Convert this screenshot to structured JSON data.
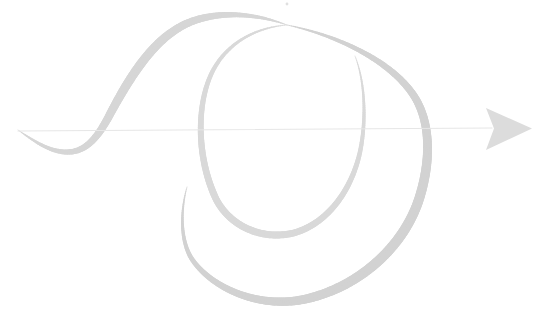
{
  "canvas": {
    "width": 551,
    "height": 321,
    "background_color": "#ffffff",
    "title": "Calligraphic flourish with horizontal arrow"
  },
  "palette": {
    "stroke_light": "#e3e3e3",
    "stroke_mid": "#d9d9d9",
    "stroke_dark": "#cfcfcf",
    "hairline": "#e8e8e8",
    "arrow_fill": "#dcdcdc",
    "speck": "#e0e0e0"
  },
  "elements": [
    {
      "id": "axis-line",
      "name": "horizontal-axis-line",
      "label": "Horizontal arrow shaft",
      "kind": "line",
      "color": "#e6e6e6",
      "stroke_width": 1.1,
      "x1": 18,
      "y1": 131,
      "x2": 492,
      "y2": 128
    },
    {
      "id": "arrow-head",
      "name": "arrow-head",
      "label": "Right-pointing arrow head",
      "kind": "polygon",
      "color": "#dcdcdc",
      "points": "486,108 532,128.5 486,150 494,128.5"
    },
    {
      "id": "sine-sweep",
      "name": "sine-sweep-stroke",
      "label": "Tapered sine sweep entering from left",
      "kind": "tapered-path",
      "color": "#d6d6d6",
      "max_width": 9,
      "path": "M 18,130 C 34,141 48,151 65,152 C 84,153 96,140 108,118 C 128,80 150,44 180,27 C 210,10 252,12 287,25"
    },
    {
      "id": "outer-loop",
      "name": "outer-loop-stroke",
      "label": "Outer descending loop of the spiral",
      "kind": "tapered-path",
      "color": "#d2d2d2",
      "max_width": 10,
      "path": "M 287,25 C 340,36 392,62 414,96 C 432,124 430,163 420,196 C 406,243 364,284 310,298 C 264,310 216,291 194,262 C 180,244 180,212 187,187"
    },
    {
      "id": "inner-loop",
      "name": "inner-loop-stroke",
      "label": "Inner loop of the spiral",
      "kind": "tapered-path",
      "color": "#d9d9d9",
      "max_width": 7,
      "path": "M 287,25 C 250,28 220,48 208,82 C 196,116 199,163 216,199 C 232,230 268,241 297,232 C 330,221 352,188 360,152 C 366,124 366,84 355,56"
    },
    {
      "id": "speck",
      "name": "ink-speck",
      "label": "Small ink speck near top centre",
      "kind": "dot",
      "color": "#e0e0e0",
      "cx": 287,
      "cy": 4,
      "r": 1.4
    }
  ],
  "chart_data": {
    "type": "line",
    "title": "Calligraphic flourish with horizontal arrow",
    "xlabel": "",
    "ylabel": "",
    "xlim": [
      0,
      551
    ],
    "ylim": [
      321,
      0
    ],
    "grid": false,
    "legend": "none",
    "annotations": [
      "Small faint speck near the top centre at (287, 4)"
    ],
    "series": [
      {
        "name": "horizontal-arrow",
        "style": "arrow",
        "color": "#e6e6e6",
        "x": [
          18,
          492
        ],
        "y": [
          131,
          128
        ]
      },
      {
        "name": "sine-sweep",
        "style": "tapered-curve",
        "color": "#d6d6d6",
        "x": [
          18,
          65,
          108,
          180,
          287
        ],
        "y": [
          130,
          152,
          118,
          27,
          25
        ]
      },
      {
        "name": "outer-loop",
        "style": "tapered-curve",
        "color": "#d2d2d2",
        "x": [
          287,
          414,
          425,
          420,
          310,
          194,
          187
        ],
        "y": [
          25,
          96,
          131,
          196,
          298,
          262,
          187
        ]
      },
      {
        "name": "inner-loop",
        "style": "tapered-curve",
        "color": "#d9d9d9",
        "x": [
          287,
          208,
          205,
          216,
          297,
          360,
          366,
          355
        ],
        "y": [
          25,
          82,
          131,
          199,
          232,
          152,
          124,
          56
        ]
      }
    ]
  }
}
